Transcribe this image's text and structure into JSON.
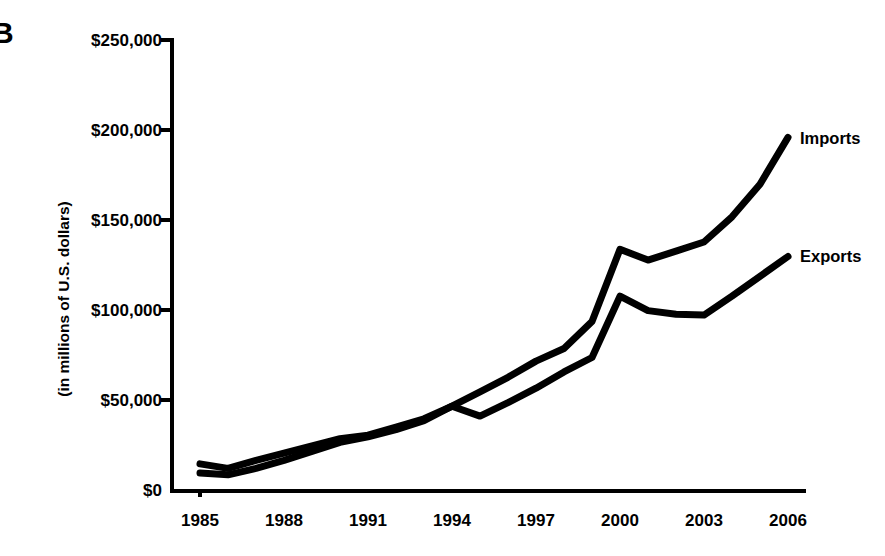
{
  "panel": {
    "letter": "B"
  },
  "axes": {
    "y_title": "(in millions of U.S. dollars)",
    "y_ticks": [
      "$0",
      "$50,000",
      "$100,000",
      "$150,000",
      "$200,000",
      "$250,000"
    ],
    "x_ticks": [
      "1985",
      "1988",
      "1991",
      "1994",
      "1997",
      "2000",
      "2003",
      "2006"
    ]
  },
  "series_labels": {
    "imports": "Imports",
    "exports": "Exports"
  },
  "colors": {
    "line": "#000000",
    "axis": "#000000",
    "background": "#ffffff"
  },
  "chart_data": {
    "type": "line",
    "title": "",
    "subtitle": "",
    "xlabel": "",
    "ylabel": "(in millions of U.S. dollars)",
    "xlim": [
      1985,
      2006
    ],
    "ylim": [
      0,
      250000
    ],
    "ytick_values": [
      0,
      50000,
      100000,
      150000,
      200000,
      250000
    ],
    "xtick_values": [
      1985,
      1988,
      1991,
      1994,
      1997,
      2000,
      2003,
      2006
    ],
    "grid": false,
    "legend_position": "right-inline-end-of-line",
    "x": [
      1985,
      1986,
      1987,
      1988,
      1989,
      1990,
      1991,
      1992,
      1993,
      1994,
      1995,
      1996,
      1997,
      1998,
      1999,
      2000,
      2001,
      2002,
      2003,
      2004,
      2005,
      2006
    ],
    "series": [
      {
        "name": "Imports",
        "values": [
          15000,
          12500,
          17000,
          21000,
          25000,
          29000,
          31000,
          35500,
          40000,
          47000,
          55000,
          63000,
          72000,
          79000,
          94000,
          134000,
          128000,
          133000,
          138000,
          152000,
          170000,
          196000
        ]
      },
      {
        "name": "Exports",
        "values": [
          10000,
          9000,
          12500,
          17000,
          22000,
          27000,
          30000,
          34000,
          39000,
          47000,
          41500,
          49000,
          57000,
          66000,
          74000,
          108000,
          100000,
          98000,
          97500,
          108000,
          119000,
          130000
        ]
      }
    ]
  }
}
